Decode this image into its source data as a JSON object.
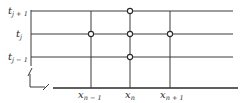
{
  "diagram": {
    "type": "finite-difference-grid",
    "colors": {
      "line": "#3a3a3a",
      "node_fill": "#ffffff",
      "background": "#ffffff"
    },
    "rows": [
      {
        "base": "t",
        "sub": "j + 1",
        "y": 11
      },
      {
        "base": "t",
        "sub": "j",
        "y": 34
      },
      {
        "base": "t",
        "sub": "j − 1",
        "y": 57
      }
    ],
    "columns": [
      {
        "base": "x",
        "sub": "n − 1",
        "x": 91
      },
      {
        "base": "x",
        "sub": "n",
        "x": 130
      },
      {
        "base": "x",
        "sub": "n + 1",
        "x": 170
      }
    ],
    "nodes": [
      {
        "col": "x_n-1",
        "row": "t_j",
        "x": 91,
        "y": 34
      },
      {
        "col": "x_n",
        "row": "t_j+1",
        "x": 130,
        "y": 11
      },
      {
        "col": "x_n",
        "row": "t_j",
        "x": 130,
        "y": 34
      },
      {
        "col": "x_n",
        "row": "t_j-1",
        "x": 130,
        "y": 57
      },
      {
        "col": "x_n+1",
        "row": "t_j",
        "x": 170,
        "y": 34
      }
    ],
    "axis_break": true
  }
}
